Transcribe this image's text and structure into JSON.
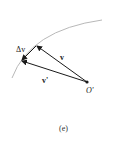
{
  "diagram": {
    "labels": {
      "delta_v": "Δv",
      "v": "v",
      "v_prime": "v'",
      "origin": "O'"
    },
    "caption": "(e)",
    "colors": {
      "arc": "#b0b0b0",
      "vectors": "#1a1a1a"
    }
  }
}
